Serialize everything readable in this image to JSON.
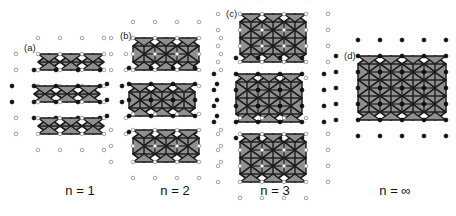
{
  "figure": {
    "background_color": "#ffffff",
    "octahedron_fill": "#8f8f8f",
    "octahedron_stroke": "#1a1a1a",
    "atom_open_stroke": "#9a9a9a",
    "atom_filled_color": "#111111"
  },
  "panels": [
    {
      "id": "a",
      "label": "(a)",
      "caption": "n = 1",
      "layers_per_block": 1,
      "octahedra_per_row": 3,
      "blocks": [
        {
          "marker": "open",
          "rows": 1,
          "cols": 3,
          "offset": 0
        },
        {
          "marker": "filled",
          "rows": 1,
          "cols": 3,
          "offset": 1
        },
        {
          "marker": "open",
          "rows": 1,
          "cols": 3,
          "offset": 0
        }
      ]
    },
    {
      "id": "b",
      "label": "(b)",
      "caption": "n = 2",
      "layers_per_block": 2,
      "octahedra_per_row": 3,
      "blocks": [
        {
          "marker": "open",
          "rows": 2,
          "cols": 3,
          "offset": 0
        },
        {
          "marker": "filled",
          "rows": 2,
          "cols": 3,
          "offset": 1
        },
        {
          "marker": "open",
          "rows": 2,
          "cols": 3,
          "offset": 0
        }
      ]
    },
    {
      "id": "c",
      "label": "(c)",
      "caption": "n = 3",
      "layers_per_block": 3,
      "octahedra_per_row": 3,
      "blocks": [
        {
          "marker": "open",
          "rows": 3,
          "cols": 3,
          "offset": 0
        },
        {
          "marker": "filled",
          "rows": 3,
          "cols": 3,
          "offset": 1
        },
        {
          "marker": "open",
          "rows": 3,
          "cols": 3,
          "offset": 0
        }
      ]
    },
    {
      "id": "d",
      "label": "(d)",
      "caption": "n = ∞",
      "layers_per_block": 4,
      "octahedra_per_row": 4,
      "blocks": [
        {
          "marker": "filled",
          "rows": 4,
          "cols": 4,
          "offset": 0
        }
      ]
    }
  ],
  "captions": {
    "n1": "n = 1",
    "n2": "n = 2",
    "n3": "n = 3",
    "ninf": "n = ∞"
  },
  "labels": {
    "a": "(a)",
    "b": "(b)",
    "c": "(c)",
    "d": "(d)"
  }
}
